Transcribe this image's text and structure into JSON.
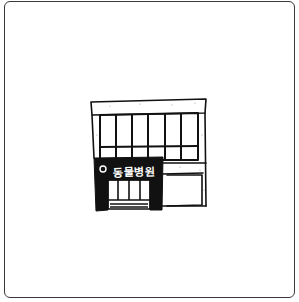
{
  "illustration": {
    "subject": "animal hospital building",
    "sign": {
      "icon": "circle-icon",
      "text": "동물병원"
    },
    "colors": {
      "line": "#111111",
      "sign_background": "#111111",
      "sign_text": "#ffffff",
      "background": "#ffffff",
      "card_border": "#3a3a3a"
    }
  }
}
